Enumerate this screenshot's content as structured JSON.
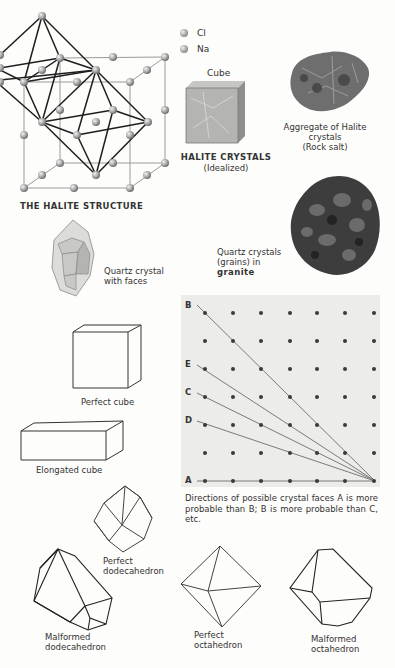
{
  "halite_structure": {
    "title": "THE HALITE STRUCTURE",
    "legend": [
      {
        "symbol": "sphere",
        "label": "Cl"
      },
      {
        "symbol": "sphere",
        "label": "Na"
      }
    ]
  },
  "halite_crystals": {
    "cube_label": "Cube",
    "title": "HALITE CRYSTALS",
    "subtitle": "(Idealized)"
  },
  "rock_salt": {
    "caption_line1": "Aggregate of Halite",
    "caption_line2": "crystals",
    "caption_line3": "(Rock salt)"
  },
  "quartz_crystal": {
    "caption_line1": "Quartz crystal",
    "caption_line2": "with faces"
  },
  "granite": {
    "caption_line1": "Quartz crystals",
    "caption_line2": "(grains) in",
    "caption_line3": "granite"
  },
  "shapes": {
    "perfect_cube": "Perfect cube",
    "elongated_cube": "Elongated cube",
    "perfect_dodecahedron_1": "Perfect",
    "perfect_dodecahedron_2": "dodecahedron",
    "malformed_dodecahedron_1": "Malformed",
    "malformed_dodecahedron_2": "dodecahedron",
    "perfect_octahedron_1": "Perfect",
    "perfect_octahedron_2": "octahedron",
    "malformed_octahedron_1": "Malformed",
    "malformed_octahedron_2": "octahedron"
  },
  "lattice": {
    "grid": {
      "columns": 7,
      "rows": 7
    },
    "direction_labels": [
      "B",
      "E",
      "C",
      "D",
      "A"
    ],
    "caption": "Directions of possible crystal faces A is more probable than B; B is more probable than C, etc."
  },
  "colors": {
    "background": "#fdfdfb",
    "lattice_panel": "#ececea",
    "lattice_dot": "#3a3a3a",
    "line": "#222222",
    "atom": "#a9a9a9"
  }
}
